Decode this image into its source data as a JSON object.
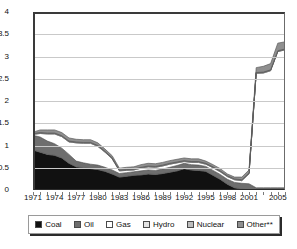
{
  "chart": {
    "type": "area",
    "ylabel": "TWh",
    "yticks": [
      "4",
      "3.5",
      "3",
      "2.5",
      "2",
      "1.5",
      "1",
      "0.5",
      "0"
    ],
    "xticks": [
      "1971",
      "1974",
      "1977",
      "1980",
      "1983",
      "1986",
      "1989",
      "1992",
      "1995",
      "1998",
      "2001",
      "2005"
    ]
  },
  "legend": {
    "items": [
      {
        "label": "Coal",
        "color": "#111111"
      },
      {
        "label": "Oil",
        "color": "#6e6e6e"
      },
      {
        "label": "Gas",
        "color": "#ffffff"
      },
      {
        "label": "Hydro",
        "color": "#e3e3e3"
      },
      {
        "label": "Nuclear",
        "color": "#bdbdbd"
      },
      {
        "label": "Other**",
        "color": "#8f8f8f"
      }
    ]
  },
  "chart_data": {
    "type": "area",
    "stacked": true,
    "title": "",
    "xlabel": "",
    "ylabel": "TWh",
    "ylim": [
      0,
      4
    ],
    "ytick_step": 0.5,
    "grid": true,
    "legend_position": "bottom",
    "categories": [
      1971,
      1972,
      1973,
      1974,
      1975,
      1976,
      1977,
      1978,
      1979,
      1980,
      1981,
      1982,
      1983,
      1984,
      1985,
      1986,
      1987,
      1988,
      1989,
      1990,
      1991,
      1992,
      1993,
      1994,
      1995,
      1996,
      1997,
      1998,
      1999,
      2000,
      2001,
      2002,
      2003,
      2004,
      2005,
      2006
    ],
    "series": [
      {
        "name": "Coal",
        "color": "#111111",
        "values": [
          0.9,
          0.85,
          0.8,
          0.78,
          0.72,
          0.6,
          0.52,
          0.5,
          0.48,
          0.46,
          0.42,
          0.36,
          0.29,
          0.31,
          0.33,
          0.34,
          0.36,
          0.35,
          0.37,
          0.4,
          0.43,
          0.48,
          0.45,
          0.44,
          0.42,
          0.33,
          0.24,
          0.13,
          0.05,
          0.02,
          0.0,
          0.0,
          0.0,
          0.0,
          0.0,
          0.0
        ]
      },
      {
        "name": "Oil",
        "color": "#6e6e6e",
        "values": [
          0.33,
          0.34,
          0.3,
          0.26,
          0.22,
          0.2,
          0.13,
          0.11,
          0.1,
          0.1,
          0.09,
          0.09,
          0.08,
          0.08,
          0.08,
          0.09,
          0.09,
          0.09,
          0.1,
          0.11,
          0.12,
          0.12,
          0.12,
          0.12,
          0.11,
          0.11,
          0.11,
          0.11,
          0.12,
          0.13,
          0.14,
          0.05,
          0.05,
          0.05,
          0.05,
          0.05
        ]
      },
      {
        "name": "Gas",
        "color": "#ffffff",
        "values": [
          0.02,
          0.08,
          0.16,
          0.22,
          0.26,
          0.28,
          0.41,
          0.44,
          0.47,
          0.42,
          0.34,
          0.25,
          0.06,
          0.05,
          0.04,
          0.06,
          0.07,
          0.07,
          0.07,
          0.07,
          0.06,
          0.04,
          0.05,
          0.06,
          0.05,
          0.06,
          0.06,
          0.06,
          0.06,
          0.06,
          0.22,
          2.57,
          2.58,
          2.63,
          3.06,
          3.1
        ]
      },
      {
        "name": "Hydro",
        "color": "#e3e3e3",
        "values": [
          0.02,
          0.02,
          0.02,
          0.02,
          0.02,
          0.02,
          0.02,
          0.02,
          0.02,
          0.02,
          0.02,
          0.02,
          0.02,
          0.02,
          0.02,
          0.02,
          0.02,
          0.02,
          0.02,
          0.02,
          0.02,
          0.02,
          0.02,
          0.02,
          0.02,
          0.02,
          0.02,
          0.02,
          0.02,
          0.02,
          0.02,
          0.02,
          0.02,
          0.02,
          0.02,
          0.02
        ]
      },
      {
        "name": "Nuclear",
        "color": "#bdbdbd",
        "values": [
          0.0,
          0.0,
          0.0,
          0.0,
          0.0,
          0.0,
          0.0,
          0.0,
          0.0,
          0.0,
          0.0,
          0.0,
          0.0,
          0.0,
          0.0,
          0.0,
          0.0,
          0.0,
          0.0,
          0.0,
          0.0,
          0.0,
          0.0,
          0.0,
          0.0,
          0.0,
          0.0,
          0.0,
          0.0,
          0.0,
          0.0,
          0.0,
          0.0,
          0.0,
          0.0,
          0.0
        ]
      },
      {
        "name": "Other**",
        "color": "#8f8f8f",
        "values": [
          0.03,
          0.06,
          0.07,
          0.07,
          0.07,
          0.07,
          0.06,
          0.06,
          0.06,
          0.06,
          0.05,
          0.05,
          0.04,
          0.05,
          0.05,
          0.06,
          0.06,
          0.06,
          0.06,
          0.06,
          0.06,
          0.06,
          0.06,
          0.06,
          0.05,
          0.05,
          0.05,
          0.04,
          0.04,
          0.06,
          0.07,
          0.11,
          0.13,
          0.14,
          0.17,
          0.16
        ]
      }
    ]
  }
}
